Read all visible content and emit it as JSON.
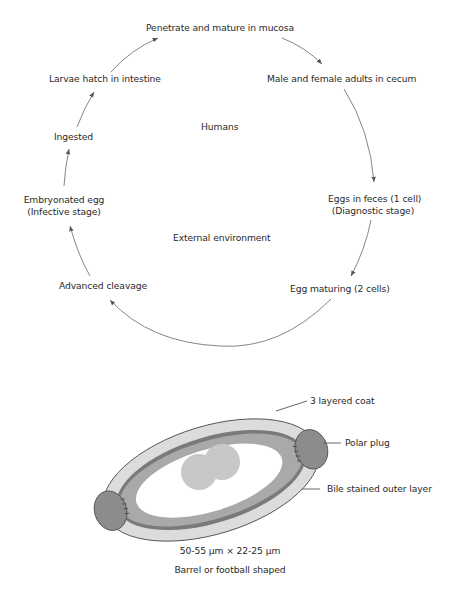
{
  "cycle": {
    "stages": [
      {
        "id": "penetrate",
        "label": "Penetrate and mature in mucosa"
      },
      {
        "id": "adults",
        "label": "Male and female adults in cecum"
      },
      {
        "id": "feces",
        "label": "Eggs in feces (1 cell)",
        "sublabel": "(Diagnostic stage)"
      },
      {
        "id": "maturing",
        "label": "Egg maturing (2 cells)"
      },
      {
        "id": "cleavage",
        "label": "Advanced cleavage"
      },
      {
        "id": "embryonated",
        "label": "Embryonated egg",
        "sublabel": "(Infective stage)"
      },
      {
        "id": "ingested",
        "label": "Ingested"
      },
      {
        "id": "larvae",
        "label": "Larvae hatch in intestine"
      }
    ],
    "zones": {
      "host": "Humans",
      "environment": "External environment"
    }
  },
  "egg": {
    "labels": {
      "coat": "3 layered coat",
      "plug": "Polar plug",
      "outer": "Bile stained outer layer"
    },
    "dimensions": "50-55 µm × 22-25 µm",
    "shape": "Barrel or football shaped",
    "colors": {
      "outer_layer": "#dcdcdc",
      "dark_band": "#7a7a7a",
      "mid_band": "#a9a9a9",
      "interior": "#ffffff",
      "cells": "#c8c8c8",
      "plugs": "#8c8c8c",
      "stroke": "#555555"
    }
  }
}
